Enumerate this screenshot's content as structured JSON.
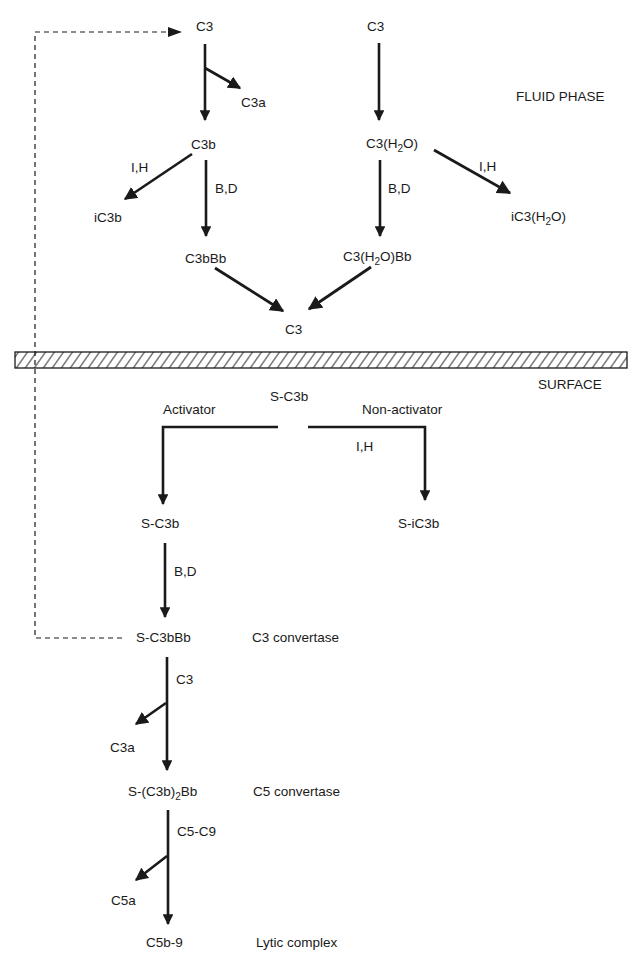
{
  "diagram": {
    "type": "flowchart",
    "regions": {
      "fluid_phase": "FLUID PHASE",
      "surface": "SURFACE"
    },
    "colors": {
      "ink": "#1a1a1a",
      "background": "#ffffff"
    },
    "nodes": {
      "c3_left_top": "C3",
      "c3a_top": "C3a",
      "c3b": "C3b",
      "ic3b": "iC3b",
      "c3bbb": "C3bBb",
      "c3_right_top": "C3",
      "c3h2o_pre": "C3(H",
      "c3h2o_sub": "2",
      "c3h2o_post": "O)",
      "ic3h2o_pre": "iC3(H",
      "ic3h2o_sub": "2",
      "ic3h2o_post": "O)",
      "c3h2obb_pre": "C3(H",
      "c3h2obb_sub": "2",
      "c3h2obb_post": "O)Bb",
      "c3_merge": "C3",
      "s_c3b_top": "S-C3b",
      "s_c3b": "S-C3b",
      "s_ic3b": "S-iC3b",
      "s_c3bbb": "S-C3bBb",
      "c3a_bottom": "C3a",
      "s_c3b2bb_pre": "S-(C3b)",
      "s_c3b2bb_sub": "2",
      "s_c3b2bb_post": "Bb",
      "c5a": "C5a",
      "c5b9": "C5b-9"
    },
    "edge_labels": {
      "ih_left": "I,H",
      "bd_left": "B,D",
      "ih_right": "I,H",
      "bd_right": "B,D",
      "activator": "Activator",
      "non_activator": "Non-activator",
      "ih_surface": "I,H",
      "bd_surface": "B,D",
      "c3_input": "C3",
      "c5c9_input": "C5-C9"
    },
    "annotations": {
      "c3_convertase": "C3 convertase",
      "c5_convertase": "C5 convertase",
      "lytic_complex": "Lytic complex"
    },
    "edges": [
      {
        "from": "C3",
        "to": "C3b",
        "side_product": "C3a"
      },
      {
        "from": "C3b",
        "to": "iC3b",
        "label": "I,H"
      },
      {
        "from": "C3b",
        "to": "C3bBb",
        "label": "B,D"
      },
      {
        "from": "C3",
        "to": "C3(H2O)"
      },
      {
        "from": "C3(H2O)",
        "to": "iC3(H2O)",
        "label": "I,H"
      },
      {
        "from": "C3(H2O)",
        "to": "C3(H2O)Bb",
        "label": "B,D"
      },
      {
        "from": "C3bBb",
        "to": "C3"
      },
      {
        "from": "C3(H2O)Bb",
        "to": "C3"
      },
      {
        "from": "S-C3b",
        "to": "S-C3b",
        "label": "Activator"
      },
      {
        "from": "S-C3b",
        "to": "S-iC3b",
        "label": "Non-activator; I,H"
      },
      {
        "from": "S-C3b",
        "to": "S-C3bBb",
        "label": "B,D"
      },
      {
        "from": "S-C3bBb",
        "to": "S-(C3b)2Bb",
        "label": "C3",
        "side_product": "C3a"
      },
      {
        "from": "S-(C3b)2Bb",
        "to": "C5b-9",
        "label": "C5-C9",
        "side_product": "C5a"
      },
      {
        "from": "S-C3bBb",
        "to": "C3",
        "style": "dashed",
        "meaning": "amplification loop"
      }
    ]
  }
}
